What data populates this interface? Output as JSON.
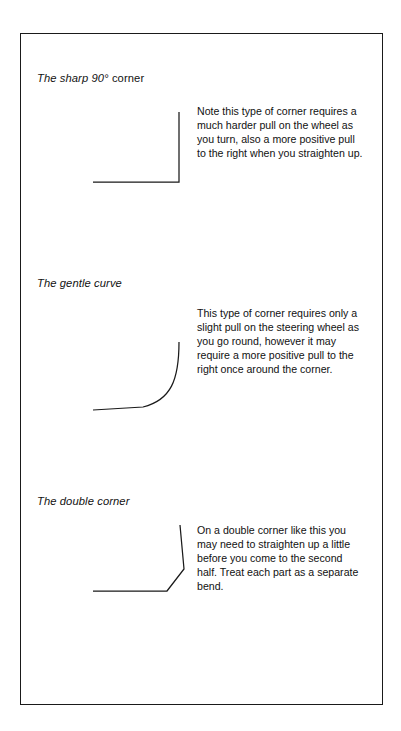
{
  "page": {
    "background_color": "#ffffff",
    "frame_color": "#1a1a1a",
    "text_color": "#111111"
  },
  "sections": [
    {
      "id": "sharp-90-corner",
      "title_italic": "The sharp 90°",
      "title_roman": " corner",
      "title_full": "The sharp 90° corner",
      "body": "Note this type of corner requires a much harder pull on the wheel as you turn, also a more positive pull to the right when you straighten up.",
      "figure_name": "sharp-90-corner-diagram"
    },
    {
      "id": "gentle-curve",
      "title_italic": "The gentle curve",
      "title_roman": "",
      "title_full": "The gentle curve",
      "body": "This type of corner requires only a slight pull on the steering wheel as you go round, however it may require a more positive pull to the right once around the corner.",
      "figure_name": "gentle-curve-diagram"
    },
    {
      "id": "double-corner",
      "title_italic": "The double corner",
      "title_roman": "",
      "title_full": "The double corner",
      "body": "On a double corner like this you may need to straighten up a little before you come to the second half. Treat each part as a separate bend.",
      "figure_name": "double-corner-diagram"
    }
  ]
}
